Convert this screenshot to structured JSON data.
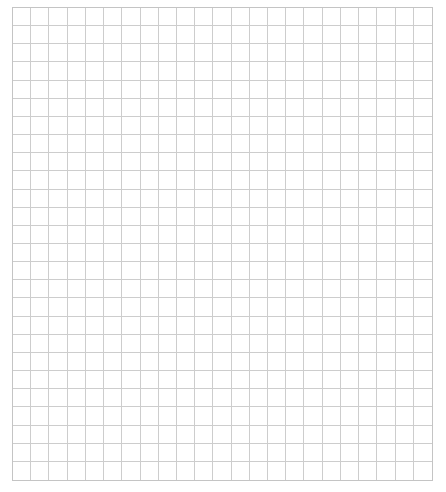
{
  "grid": {
    "columns": 23,
    "rows": 26,
    "line_color": "#cdcdcd",
    "border_color": "#c4c4c4",
    "background": "#ffffff",
    "cells_filled": []
  }
}
